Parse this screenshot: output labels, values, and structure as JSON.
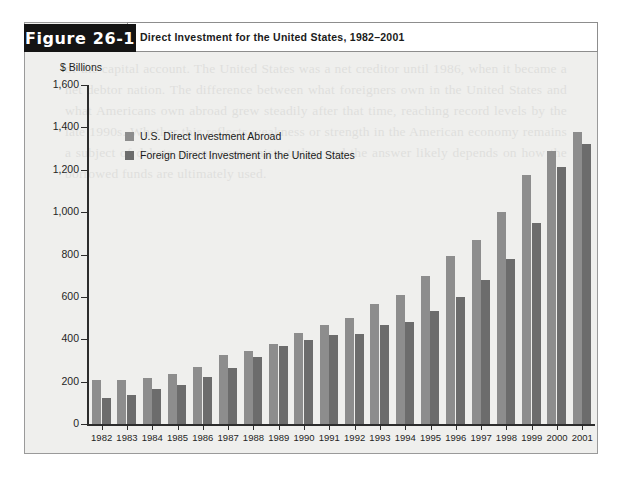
{
  "figure": {
    "tab_label": "Figure 26-1",
    "title": "Direct Investment for the United States, 1982–2001",
    "background_color": "#efefed",
    "tab_color": "#141414"
  },
  "ghost_text": "of the capital account. The United States was a net creditor until 1986, when it became a net debtor nation. The difference between what foreigners own in the United States and what Americans own abroad grew steadily after that time, reaching record levels by the late 1990s. Whether this reflects weakness or strength in the American economy remains a subject of debate among economists today, and the answer likely depends on how the borrowed funds are ultimately used.",
  "chart_data": {
    "type": "bar",
    "title": "Direct Investment for the United States, 1982–2001",
    "xlabel": "",
    "ylabel": "$ Billions",
    "ylim": [
      0,
      1600
    ],
    "yticks": [
      "0",
      "200",
      "400",
      "600",
      "800",
      "1,000",
      "1,200",
      "1,400",
      "1,600"
    ],
    "ytick_values": [
      0,
      200,
      400,
      600,
      800,
      1000,
      1200,
      1400,
      1600
    ],
    "grid": false,
    "legend_position": "upper-left-inside",
    "categories": [
      "1982",
      "1983",
      "1984",
      "1985",
      "1986",
      "1987",
      "1988",
      "1989",
      "1990",
      "1991",
      "1992",
      "1993",
      "1994",
      "1995",
      "1996",
      "1997",
      "1998",
      "1999",
      "2000",
      "2001"
    ],
    "series": [
      {
        "name": "U.S. Direct Investment Abroad",
        "color": "#8d8d8d",
        "values": [
          207,
          210,
          215,
          235,
          270,
          325,
          345,
          380,
          430,
          465,
          500,
          565,
          610,
          700,
          795,
          870,
          1000,
          1175,
          1290,
          1380
        ]
      },
      {
        "name": "Foreign Direct Investment in the United States",
        "color": "#6c6c6c",
        "values": [
          125,
          137,
          165,
          185,
          220,
          265,
          315,
          370,
          395,
          420,
          425,
          465,
          480,
          535,
          600,
          680,
          780,
          950,
          1215,
          1320
        ]
      }
    ]
  }
}
